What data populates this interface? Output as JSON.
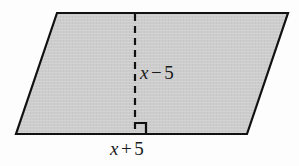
{
  "figure": {
    "type": "parallelogram",
    "fill_color": "#cccccc",
    "stroke_color": "#111111",
    "background_color": "#fdfdfd",
    "vertices": {
      "top_left": [
        57,
        13
      ],
      "top_right": [
        288,
        13
      ],
      "bottom_right": [
        247,
        134
      ],
      "bottom_left": [
        16,
        134
      ]
    },
    "height_segment": {
      "x": 135,
      "y_top": 13,
      "y_bottom": 134,
      "style": "dashed"
    },
    "right_angle_marker": {
      "x": 135,
      "y": 134,
      "size": 11,
      "opens": "right-up"
    }
  },
  "labels": {
    "height": {
      "variable": "x",
      "operator": "−",
      "constant": "5",
      "full": "x − 5"
    },
    "base": {
      "variable": "x",
      "operator": "+",
      "constant": "5",
      "full": "x + 5"
    }
  }
}
